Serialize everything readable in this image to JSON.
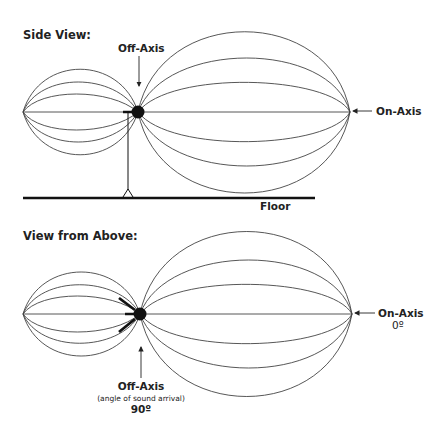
{
  "side_view": {
    "title": "Side View:",
    "off_axis_label": "Off-Axis",
    "on_axis_label": "On-Axis",
    "floor_label": "Floor"
  },
  "above_view": {
    "title": "View from Above:",
    "off_axis_label": "Off-Axis",
    "off_axis_sublabel": "(angle of sound arrival)",
    "off_axis_angle": "90º",
    "on_axis_label": "On-Axis",
    "on_axis_angle": "0º"
  },
  "icons": {
    "microphone_side": "microphone-on-stand-icon",
    "microphone_above": "microphone-top-view-icon"
  },
  "colors": {
    "line": "#444444",
    "ink": "#111111",
    "background": "#ffffff"
  }
}
